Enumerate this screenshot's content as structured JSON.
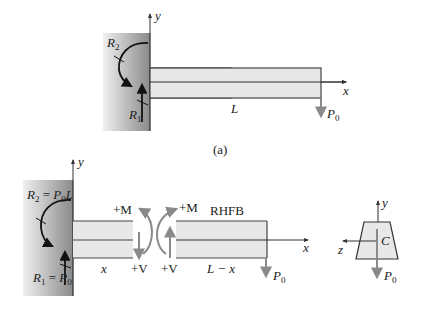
{
  "figure": {
    "caption_a": "(a)",
    "colors": {
      "wall_dark": "#8e8e8e",
      "wall_light": "#e6e6e6",
      "beam_fill": "#e8e8e8",
      "beam_edge": "#444444",
      "black_arrow": "#111111",
      "gray_arrow": "#8a8a8a",
      "axis": "#333333"
    }
  },
  "part_a": {
    "axis_y": "y",
    "axis_x": "x",
    "moment_reaction": {
      "sym": "R",
      "sub": "2"
    },
    "force_reaction": {
      "sym": "R",
      "sub": "1"
    },
    "length": "L",
    "load": {
      "sym": "P",
      "sub": "0"
    }
  },
  "part_b": {
    "axis_y": "y",
    "axis_x": "x",
    "moment_reaction": {
      "sym": "R",
      "sub": "2",
      "eq": " = ",
      "rhs_sym": "P",
      "rhs_sub": "0",
      "rhs_tail": "L"
    },
    "force_reaction": {
      "sym": "R",
      "sub": "1",
      "eq": " = ",
      "rhs_sym": "P",
      "rhs_sub": "0"
    },
    "left_segment_length": "x",
    "left_moment": "+M",
    "left_shear": "+V",
    "right_moment": "+M",
    "right_shear": "+V",
    "rhfb_label": "RHFB",
    "right_segment_length": "L − x",
    "load": {
      "sym": "P",
      "sub": "0"
    }
  },
  "cross_section": {
    "axis_y": "y",
    "axis_z": "z",
    "centroid": "C",
    "load": {
      "sym": "P",
      "sub": "0"
    }
  }
}
